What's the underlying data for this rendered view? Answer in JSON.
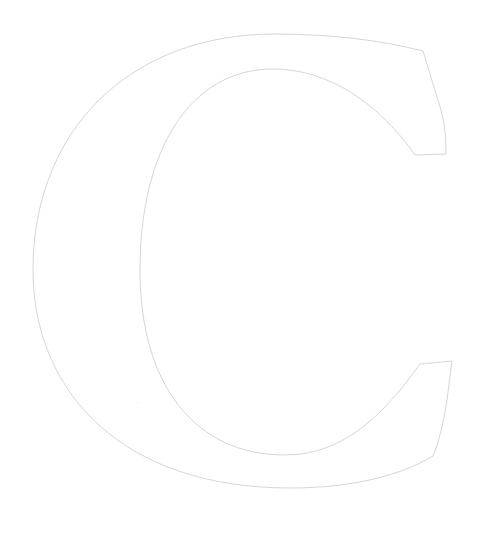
{
  "glyph": {
    "character": "C",
    "style": "outlined serif capital letter",
    "stroke_color": "#d6d6d6",
    "fill_color": "#ffffff",
    "background_color": "#ffffff"
  }
}
